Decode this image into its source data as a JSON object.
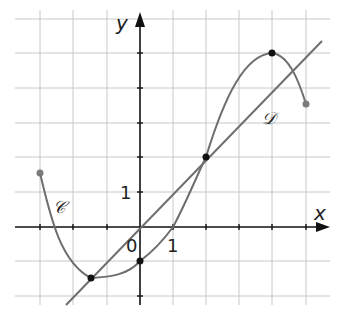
{
  "graph": {
    "axis_x_label": "x",
    "axis_y_label": "y",
    "origin_label": "0",
    "unit_x_label": "1",
    "unit_y_label": "1",
    "curve_label": "𝒞",
    "line_label": "𝒟",
    "curve_color": "#6e6e6e",
    "grid_color": "#c8c8c8",
    "x_range": [
      -3,
      5.5
    ],
    "y_range": [
      -2.1,
      6
    ],
    "curve_points": [
      [
        -3,
        1.6
      ],
      [
        -1.5,
        -1.5
      ],
      [
        0,
        -1
      ],
      [
        1,
        0
      ],
      [
        2,
        2
      ],
      [
        4,
        5
      ],
      [
        5,
        3.7
      ]
    ],
    "line_points": [
      [
        -2.2,
        -2.2
      ],
      [
        5.5,
        5.5
      ]
    ],
    "marked_points": [
      [
        -1.5,
        -1.5
      ],
      [
        0,
        -1
      ],
      [
        2,
        2
      ],
      [
        4,
        5
      ]
    ],
    "endpoints": [
      [
        -3,
        1.6
      ],
      [
        5,
        3.7
      ]
    ]
  }
}
